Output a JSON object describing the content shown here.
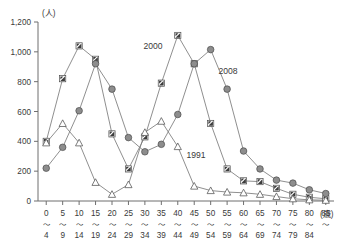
{
  "chart_data": {
    "type": "line",
    "title": "",
    "xlabel": "(歳)",
    "ylabel": "(人)",
    "ylim": [
      0,
      1200
    ],
    "yticks": [
      "0",
      "200",
      "400",
      "600",
      "800",
      "1,000",
      "1,200"
    ],
    "ytick_values": [
      0,
      200,
      400,
      600,
      800,
      1000,
      1200
    ],
    "grid": false,
    "legend_position": "inline-annotations",
    "categories": [
      "0\n~\n4",
      "5\n~\n9",
      "10\n~\n14",
      "15\n~\n19",
      "20\n~\n24",
      "25\n~\n29",
      "30\n~\n34",
      "35\n~\n39",
      "40\n~\n44",
      "45\n~\n49",
      "50\n~\n54",
      "55\n~\n59",
      "60\n~\n64",
      "65\n~\n69",
      "70\n~\n74",
      "75\n~\n79",
      "80\n~\n84",
      "85\n~"
    ],
    "category_starts": [
      "0",
      "5",
      "10",
      "15",
      "20",
      "25",
      "30",
      "35",
      "40",
      "45",
      "50",
      "55",
      "60",
      "65",
      "70",
      "75",
      "80",
      "85"
    ],
    "category_ends": [
      "4",
      "9",
      "14",
      "19",
      "24",
      "29",
      "34",
      "39",
      "44",
      "49",
      "54",
      "59",
      "64",
      "69",
      "74",
      "79",
      "84",
      ""
    ],
    "series": [
      {
        "name": "2000",
        "marker": "half-filled-square",
        "label": "2000",
        "values": [
          400,
          820,
          1040,
          950,
          450,
          215,
          430,
          790,
          1110,
          920,
          520,
          215,
          135,
          130,
          85,
          45,
          25,
          15
        ]
      },
      {
        "name": "2008",
        "marker": "filled-circle",
        "label": "2008",
        "values": [
          220,
          360,
          605,
          920,
          750,
          425,
          330,
          380,
          580,
          920,
          1015,
          750,
          335,
          215,
          140,
          120,
          75,
          50
        ]
      },
      {
        "name": "1991",
        "marker": "open-triangle",
        "label": "1991",
        "values": [
          390,
          520,
          390,
          125,
          45,
          110,
          460,
          535,
          365,
          100,
          70,
          60,
          55,
          45,
          30,
          15,
          8,
          5
        ]
      }
    ],
    "annotations": [
      {
        "text": "2000",
        "series": "2000"
      },
      {
        "text": "2008",
        "series": "2008"
      },
      {
        "text": "1991",
        "series": "1991"
      }
    ]
  }
}
